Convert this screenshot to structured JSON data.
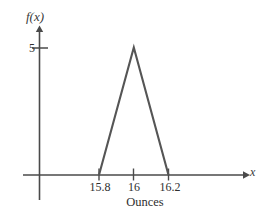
{
  "chart_data": {
    "type": "line",
    "title": "",
    "subtitle": "",
    "xlabel": "Ounces",
    "ylabel": "f(x)",
    "x_axis_symbol": "x",
    "xlim": [
      15.7,
      16.35
    ],
    "ylim": [
      0,
      5.8
    ],
    "grid": false,
    "legend": null,
    "annotations": [],
    "x_ticks": [
      {
        "value": 15.8,
        "label": "15.8"
      },
      {
        "value": 16,
        "label": "16"
      },
      {
        "value": 16.2,
        "label": "16.2"
      }
    ],
    "y_ticks": [
      {
        "value": 5,
        "label": "5"
      }
    ],
    "series": [
      {
        "name": "triangular density",
        "points": [
          {
            "x": 15.8,
            "y": 0
          },
          {
            "x": 16.0,
            "y": 5
          },
          {
            "x": 16.2,
            "y": 0
          }
        ]
      }
    ],
    "line_color": "#555555"
  },
  "figure": {
    "y_axis_label": "f(x)",
    "x_axis_label": "x",
    "caption": "Ounces",
    "y_tick_5": "5",
    "x_tick_158": "15.8",
    "x_tick_16": "16",
    "x_tick_162": "16.2"
  }
}
